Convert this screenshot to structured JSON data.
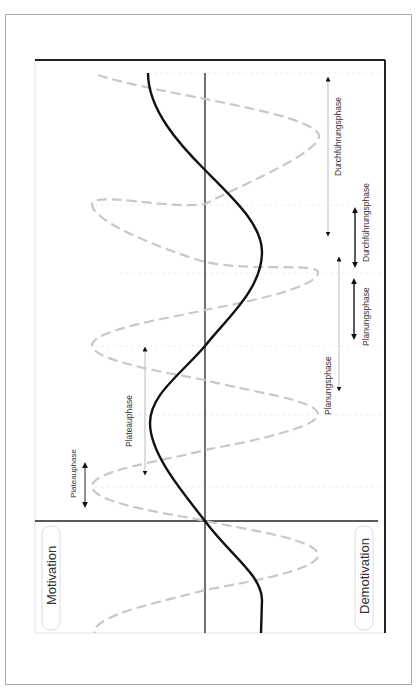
{
  "diagram": {
    "type": "motivation-phase-waves",
    "orientation": "rotated-90",
    "axis_labels": {
      "left": "Motivation",
      "right": "Demotivation"
    },
    "curves": [
      {
        "name": "overall-motivation",
        "style": "solid",
        "color": "#111111"
      },
      {
        "name": "phase-motivation",
        "style": "dashed",
        "color": "#c8c8c8"
      }
    ],
    "phases": [
      {
        "id": "durchfuehrung-long",
        "label": "Durchführungsphase",
        "arrow": "thin"
      },
      {
        "id": "durchfuehrung-short",
        "label": "Durchführungsphase",
        "arrow": "thick"
      },
      {
        "id": "planung-short",
        "label": "Planungsphase",
        "arrow": "thick"
      },
      {
        "id": "planung-long",
        "label": "Planungsphase",
        "arrow": "thin"
      },
      {
        "id": "plateau-long",
        "label": "Plateauphase",
        "arrow": "thin"
      },
      {
        "id": "plateau-short",
        "label": "Plateauphase",
        "arrow": "thick"
      }
    ],
    "colors": {
      "frame": "#aaaaaa",
      "chart_border": "#222222",
      "axis": "#222222",
      "dashed_curve": "#c8c8c8",
      "guide": "#eeeeee",
      "label_box": "#dddddd"
    }
  }
}
